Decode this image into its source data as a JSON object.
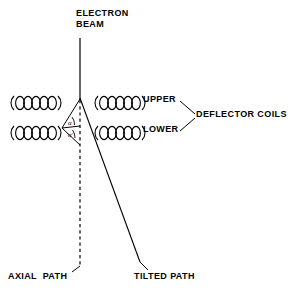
{
  "diagram": {
    "type": "schematic",
    "stroke_color": "#000000",
    "background_color": "#ffffff",
    "labels": {
      "beam_line1": "ELECTRON",
      "beam_line2": "BEAM",
      "upper": "UPPER",
      "lower": "LOWER",
      "deflector_coils": "DEFLECTOR COILS",
      "axial_path": "AXIAL  PATH",
      "tilted_path": "TILTED PATH",
      "angle_alpha": "α",
      "angle_alpha_prime": "α'"
    },
    "coils": {
      "count": 4,
      "loops_per_coil": 5,
      "positions": [
        {
          "name": "left-upper-coil",
          "x": 12,
          "y": 101
        },
        {
          "name": "left-lower-coil",
          "x": 12,
          "y": 131
        },
        {
          "name": "right-upper-coil",
          "x": 96,
          "y": 101
        },
        {
          "name": "right-lower-coil",
          "x": 96,
          "y": 131
        }
      ]
    },
    "paths": {
      "electron_beam": {
        "x1": 80,
        "y1": 38,
        "x2": 80,
        "y2": 100
      },
      "axial_path": {
        "x1": 80,
        "y1": 100,
        "x2": 80,
        "y2": 266,
        "style": "dashed"
      },
      "tilted_path": {
        "x1": 80,
        "y1": 98,
        "x2": 140,
        "y2": 262,
        "style": "solid"
      }
    }
  }
}
